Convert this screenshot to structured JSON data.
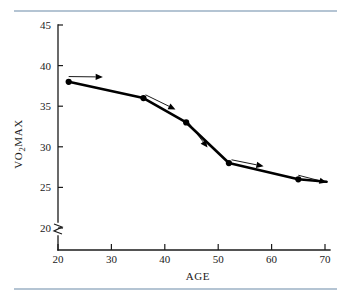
{
  "figure": {
    "name": "vo2max-vs-age-line-chart",
    "top_rule_color": "#6a8aa8",
    "bottom_rule_color": "#6a8aa8",
    "line_color": "#000000",
    "text_color": "#1a1a1a",
    "background": "#ffffff"
  },
  "chart_data": {
    "type": "line",
    "title": "",
    "subtitle": "",
    "xlabel": "AGE",
    "ylabel": "VO2MAX",
    "ylabel_parts": {
      "pre": "VO",
      "sub": "2",
      "post": "MAX"
    },
    "x": [
      22,
      36,
      44,
      52,
      65
    ],
    "values": [
      38,
      36,
      33,
      28,
      26
    ],
    "series": [
      {
        "name": "VO2MAX decline with age",
        "x": [
          22,
          36,
          44,
          52,
          65
        ],
        "values": [
          38,
          36,
          33,
          28,
          26
        ]
      }
    ],
    "points": [
      {
        "age": 22,
        "vo2max": 38
      },
      {
        "age": 36,
        "vo2max": 36
      },
      {
        "age": 44,
        "vo2max": 33
      },
      {
        "age": 52,
        "vo2max": 28
      },
      {
        "age": 65,
        "vo2max": 26
      }
    ],
    "xlim": [
      20,
      70
    ],
    "ylim": [
      20,
      45
    ],
    "xticks": [
      20,
      30,
      40,
      50,
      60,
      70
    ],
    "yticks": [
      20,
      25,
      30,
      35,
      40,
      45
    ],
    "xticklabels": [
      "20",
      "30",
      "40",
      "50",
      "60",
      "70"
    ],
    "yticklabels": [
      "20",
      "25",
      "30",
      "35",
      "40",
      "45"
    ],
    "grid": false,
    "legend": false,
    "legend_position": "none",
    "y_axis_break": true,
    "y_axis_break_note": "axis break symbol below 20",
    "annotations": [
      {
        "name": "slope-arrow-1",
        "from_age": 22,
        "from_vo2max": 38.65,
        "to_age": 28.4,
        "to_vo2max": 38.6,
        "style": "shallow-decline"
      },
      {
        "name": "slope-arrow-2",
        "from_age": 36.4,
        "from_vo2max": 36.4,
        "to_age": 42.0,
        "to_vo2max": 34.6,
        "style": "moderate-decline"
      },
      {
        "name": "slope-arrow-3",
        "from_age": 44.3,
        "from_vo2max": 33.1,
        "to_age": 48.0,
        "to_vo2max": 29.9,
        "style": "steep-decline"
      },
      {
        "name": "slope-arrow-4",
        "from_age": 52.5,
        "from_vo2max": 28.4,
        "to_age": 58.5,
        "to_vo2max": 27.6,
        "style": "shallow-decline"
      },
      {
        "name": "slope-arrow-5",
        "from_age": 65.0,
        "from_vo2max": 26.5,
        "to_age": 70.3,
        "to_vo2max": 25.6,
        "style": "shallow-decline"
      }
    ],
    "line_tail": {
      "to_age": 70.3,
      "to_vo2max": 25.7
    }
  }
}
